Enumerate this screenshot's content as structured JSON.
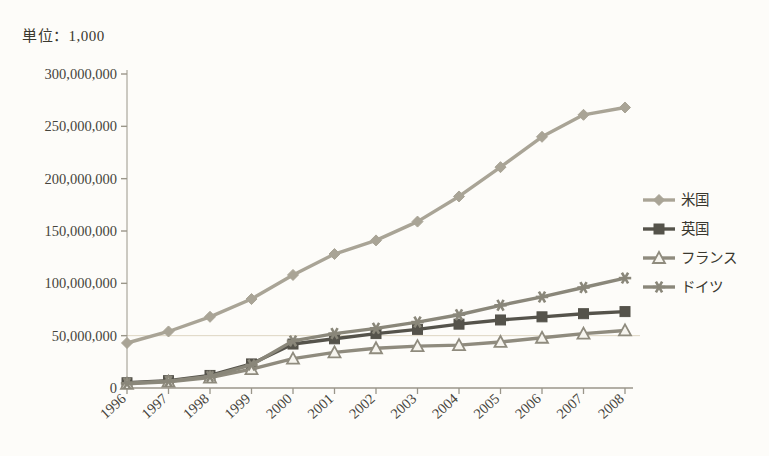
{
  "unit_label": "単位：1,000",
  "chart_data": {
    "type": "line",
    "title": "",
    "subtitle": "",
    "unit_note": "単位：1,000",
    "xlabel": "",
    "ylabel": "",
    "grid": "horizontal-single-50m",
    "legend_position": "right",
    "categories": [
      "1996",
      "1997",
      "1998",
      "1999",
      "2000",
      "2001",
      "2002",
      "2003",
      "2004",
      "2005",
      "2006",
      "2007",
      "2008"
    ],
    "x_tick_labels": [
      "1996",
      "1997",
      "1998",
      "1999",
      "2000",
      "2001",
      "2002",
      "2003",
      "2004",
      "2005",
      "2006",
      "2007",
      "2008"
    ],
    "y_tick_labels": [
      "0",
      "50,000,000",
      "100,000,000",
      "150,000,000",
      "200,000,000",
      "250,000,000",
      "300,000,000"
    ],
    "y_tick_values": [
      0,
      50000000,
      100000000,
      150000000,
      200000000,
      250000000,
      300000000
    ],
    "ylim": [
      0,
      300000000
    ],
    "xlim_labels": [
      "1996",
      "2008"
    ],
    "series": [
      {
        "name": "米国",
        "marker": "diamond",
        "color": "#a9a496",
        "values": [
          43000000,
          54000000,
          68000000,
          85000000,
          108000000,
          128000000,
          141000000,
          159000000,
          183000000,
          211000000,
          240000000,
          261000000,
          268000000
        ]
      },
      {
        "name": "英国",
        "marker": "square-filled",
        "color": "#55534b",
        "values": [
          5000000,
          7000000,
          12000000,
          23000000,
          42000000,
          47000000,
          52000000,
          56000000,
          61000000,
          65000000,
          68000000,
          71000000,
          73000000
        ]
      },
      {
        "name": "フランス",
        "marker": "triangle-open",
        "color": "#8f8b7e",
        "values": [
          4000000,
          6000000,
          10000000,
          18000000,
          28000000,
          34000000,
          38000000,
          40000000,
          41000000,
          44000000,
          48000000,
          52000000,
          55000000
        ]
      },
      {
        "name": "ドイツ",
        "marker": "star",
        "color": "#8a877a",
        "values": [
          4500000,
          6500000,
          11000000,
          22000000,
          45000000,
          52000000,
          57000000,
          63000000,
          70000000,
          79000000,
          87000000,
          96000000,
          105000000
        ]
      }
    ]
  },
  "legend": {
    "items": [
      {
        "label": "米国"
      },
      {
        "label": "英国"
      },
      {
        "label": "フランス"
      },
      {
        "label": "ドイツ"
      }
    ]
  }
}
